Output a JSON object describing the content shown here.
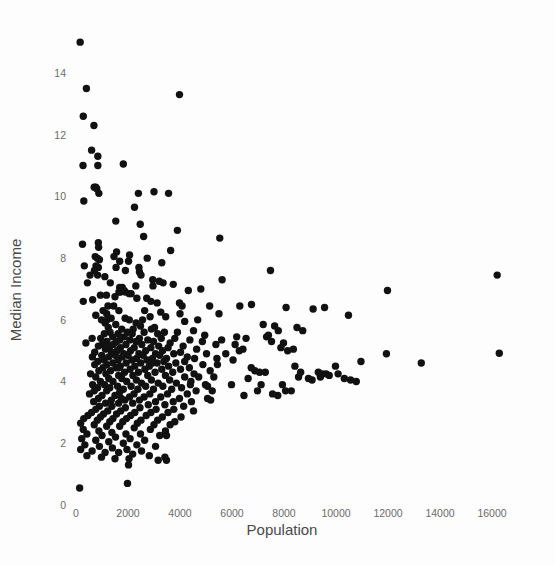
{
  "chart_data": {
    "type": "scatter",
    "title": "",
    "xlabel": "Population",
    "ylabel": "Median Income",
    "xlim": [
      -700,
      17400
    ],
    "ylim": [
      -0.45,
      15.6
    ],
    "xticks": [
      0,
      2000,
      4000,
      6000,
      8000,
      10000,
      12000,
      14000,
      16000
    ],
    "xticklabels": [
      "0",
      "2000",
      "4000",
      "6000",
      "8000",
      "10000",
      "12000",
      "14000",
      "16000"
    ],
    "yticks": [
      0,
      2,
      4,
      6,
      8,
      10,
      12,
      14
    ],
    "yticklabels": [
      "0",
      "2",
      "4",
      "6",
      "8",
      "10",
      "12",
      "14"
    ],
    "grid": false,
    "legend": null,
    "marker": {
      "shape": "circle",
      "color": "#111111",
      "size": 4.6
    },
    "n_points": 420,
    "points": [
      [
        160,
        15.0
      ],
      [
        400,
        13.5
      ],
      [
        3980,
        13.3
      ],
      [
        280,
        12.6
      ],
      [
        690,
        12.3
      ],
      [
        600,
        11.5
      ],
      [
        840,
        11.3
      ],
      [
        270,
        11.0
      ],
      [
        840,
        11.0
      ],
      [
        1820,
        11.05
      ],
      [
        700,
        10.3
      ],
      [
        760,
        10.3
      ],
      [
        800,
        10.25
      ],
      [
        880,
        10.1
      ],
      [
        2400,
        10.1
      ],
      [
        3000,
        10.15
      ],
      [
        3560,
        10.1
      ],
      [
        300,
        9.85
      ],
      [
        2250,
        9.65
      ],
      [
        1530,
        9.2
      ],
      [
        2470,
        9.1
      ],
      [
        3900,
        8.9
      ],
      [
        2600,
        8.7
      ],
      [
        5530,
        8.65
      ],
      [
        860,
        8.5
      ],
      [
        250,
        8.45
      ],
      [
        870,
        8.35
      ],
      [
        3640,
        8.25
      ],
      [
        1560,
        8.2
      ],
      [
        2060,
        8.1
      ],
      [
        740,
        8.05
      ],
      [
        820,
        8.0
      ],
      [
        900,
        7.95
      ],
      [
        1680,
        7.9
      ],
      [
        2020,
        7.9
      ],
      [
        320,
        7.75
      ],
      [
        770,
        7.75
      ],
      [
        860,
        7.7
      ],
      [
        1540,
        7.7
      ],
      [
        2420,
        7.7
      ],
      [
        710,
        7.6
      ],
      [
        1900,
        7.6
      ],
      [
        2440,
        7.55
      ],
      [
        7480,
        7.6
      ],
      [
        16200,
        7.45
      ],
      [
        2500,
        7.45
      ],
      [
        830,
        7.45
      ],
      [
        1110,
        7.4
      ],
      [
        2950,
        7.3
      ],
      [
        5620,
        7.3
      ],
      [
        3200,
        7.25
      ],
      [
        3350,
        7.2
      ],
      [
        440,
        7.2
      ],
      [
        2300,
        7.1
      ],
      [
        2960,
        7.1
      ],
      [
        1680,
        7.05
      ],
      [
        1780,
        7.05
      ],
      [
        4800,
        7.0
      ],
      [
        1850,
        6.95
      ],
      [
        4320,
        6.95
      ],
      [
        11980,
        6.95
      ],
      [
        1650,
        6.9
      ],
      [
        1710,
        6.9
      ],
      [
        1900,
        6.9
      ],
      [
        2050,
        6.85
      ],
      [
        940,
        6.8
      ],
      [
        1170,
        6.8
      ],
      [
        1500,
        6.75
      ],
      [
        2340,
        6.7
      ],
      [
        2720,
        6.7
      ],
      [
        640,
        6.65
      ],
      [
        280,
        6.6
      ],
      [
        3120,
        6.55
      ],
      [
        3980,
        6.55
      ],
      [
        6300,
        6.45
      ],
      [
        6750,
        6.5
      ],
      [
        1230,
        6.45
      ],
      [
        1450,
        6.45
      ],
      [
        5140,
        6.45
      ],
      [
        8080,
        6.4
      ],
      [
        9120,
        6.35
      ],
      [
        9560,
        6.4
      ],
      [
        1040,
        6.3
      ],
      [
        1650,
        6.3
      ],
      [
        2640,
        6.3
      ],
      [
        3260,
        6.25
      ],
      [
        4000,
        6.2
      ],
      [
        1180,
        6.2
      ],
      [
        760,
        6.15
      ],
      [
        10480,
        6.15
      ],
      [
        2850,
        6.1
      ],
      [
        3450,
        6.1
      ],
      [
        1350,
        6.05
      ],
      [
        1890,
        6.05
      ],
      [
        980,
        6.0
      ],
      [
        2050,
        6.0
      ],
      [
        4180,
        5.95
      ],
      [
        2310,
        5.9
      ],
      [
        1120,
        5.9
      ],
      [
        1530,
        5.85
      ],
      [
        7200,
        5.85
      ],
      [
        7640,
        5.8
      ],
      [
        2480,
        5.8
      ],
      [
        3020,
        5.75
      ],
      [
        1240,
        5.75
      ],
      [
        8500,
        5.75
      ],
      [
        1760,
        5.7
      ],
      [
        2200,
        5.7
      ],
      [
        2900,
        5.7
      ],
      [
        4520,
        5.65
      ],
      [
        7780,
        5.65
      ],
      [
        8720,
        5.65
      ],
      [
        1310,
        5.6
      ],
      [
        1980,
        5.6
      ],
      [
        2620,
        5.6
      ],
      [
        3400,
        5.6
      ],
      [
        1090,
        5.55
      ],
      [
        1620,
        5.55
      ],
      [
        2160,
        5.55
      ],
      [
        3140,
        5.55
      ],
      [
        4950,
        5.5
      ],
      [
        6180,
        5.45
      ],
      [
        7330,
        5.45
      ],
      [
        1410,
        5.45
      ],
      [
        1850,
        5.45
      ],
      [
        2440,
        5.4
      ],
      [
        3280,
        5.4
      ],
      [
        3800,
        5.4
      ],
      [
        950,
        5.4
      ],
      [
        1680,
        5.35
      ],
      [
        2070,
        5.35
      ],
      [
        2760,
        5.35
      ],
      [
        4380,
        5.35
      ],
      [
        7520,
        5.3
      ],
      [
        7980,
        5.25
      ],
      [
        1190,
        5.3
      ],
      [
        1560,
        5.3
      ],
      [
        2310,
        5.3
      ],
      [
        2980,
        5.3
      ],
      [
        3620,
        5.25
      ],
      [
        5380,
        5.2
      ],
      [
        1020,
        5.2
      ],
      [
        1440,
        5.2
      ],
      [
        1920,
        5.2
      ],
      [
        2530,
        5.2
      ],
      [
        3180,
        5.15
      ],
      [
        4120,
        5.15
      ],
      [
        860,
        5.15
      ],
      [
        1280,
        5.1
      ],
      [
        1710,
        5.1
      ],
      [
        2240,
        5.1
      ],
      [
        2880,
        5.1
      ],
      [
        3540,
        5.1
      ],
      [
        4640,
        5.05
      ],
      [
        6420,
        5.05
      ],
      [
        8140,
        5.0
      ],
      [
        1130,
        5.05
      ],
      [
        1590,
        5.0
      ],
      [
        2100,
        5.0
      ],
      [
        2680,
        5.0
      ],
      [
        3330,
        5.0
      ],
      [
        4020,
        4.95
      ],
      [
        720,
        4.95
      ],
      [
        1370,
        4.95
      ],
      [
        1840,
        4.9
      ],
      [
        2420,
        4.9
      ],
      [
        3060,
        4.9
      ],
      [
        3760,
        4.9
      ],
      [
        5020,
        4.9
      ],
      [
        11940,
        4.9
      ],
      [
        16280,
        4.92
      ],
      [
        990,
        4.85
      ],
      [
        1510,
        4.85
      ],
      [
        2000,
        4.85
      ],
      [
        2580,
        4.85
      ],
      [
        3220,
        4.85
      ],
      [
        4280,
        4.8
      ],
      [
        630,
        4.8
      ],
      [
        1260,
        4.8
      ],
      [
        1780,
        4.8
      ],
      [
        2330,
        4.75
      ],
      [
        2940,
        4.75
      ],
      [
        3480,
        4.75
      ],
      [
        4560,
        4.75
      ],
      [
        6040,
        4.7
      ],
      [
        10960,
        4.65
      ],
      [
        13280,
        4.6
      ],
      [
        1080,
        4.7
      ],
      [
        1620,
        4.7
      ],
      [
        2150,
        4.7
      ],
      [
        2730,
        4.7
      ],
      [
        3380,
        4.65
      ],
      [
        4180,
        4.65
      ],
      [
        840,
        4.65
      ],
      [
        1420,
        4.6
      ],
      [
        1930,
        4.6
      ],
      [
        2490,
        4.6
      ],
      [
        3120,
        4.6
      ],
      [
        3840,
        4.6
      ],
      [
        4880,
        4.55
      ],
      [
        5440,
        4.55
      ],
      [
        8420,
        4.5
      ],
      [
        9980,
        4.5
      ],
      [
        720,
        4.55
      ],
      [
        1190,
        4.55
      ],
      [
        1700,
        4.5
      ],
      [
        2260,
        4.5
      ],
      [
        2820,
        4.5
      ],
      [
        3560,
        4.5
      ],
      [
        4360,
        4.45
      ],
      [
        1040,
        4.45
      ],
      [
        1540,
        4.45
      ],
      [
        2080,
        4.4
      ],
      [
        2650,
        4.4
      ],
      [
        3300,
        4.4
      ],
      [
        4020,
        4.4
      ],
      [
        5160,
        4.35
      ],
      [
        6880,
        4.35
      ],
      [
        7060,
        4.3
      ],
      [
        9320,
        4.3
      ],
      [
        9480,
        4.25
      ],
      [
        9620,
        4.25
      ],
      [
        880,
        4.35
      ],
      [
        1330,
        4.35
      ],
      [
        1870,
        4.3
      ],
      [
        2400,
        4.3
      ],
      [
        3040,
        4.3
      ],
      [
        3720,
        4.3
      ],
      [
        4540,
        4.25
      ],
      [
        560,
        4.25
      ],
      [
        1150,
        4.25
      ],
      [
        1640,
        4.2
      ],
      [
        2190,
        4.2
      ],
      [
        2760,
        4.2
      ],
      [
        3440,
        4.2
      ],
      [
        4180,
        4.15
      ],
      [
        5300,
        4.15
      ],
      [
        6620,
        4.1
      ],
      [
        8560,
        4.15
      ],
      [
        8940,
        4.1
      ],
      [
        10560,
        4.05
      ],
      [
        760,
        4.15
      ],
      [
        1260,
        4.1
      ],
      [
        1760,
        4.1
      ],
      [
        2320,
        4.05
      ],
      [
        2900,
        4.05
      ],
      [
        3600,
        4.05
      ],
      [
        4420,
        4.0
      ],
      [
        940,
        4.0
      ],
      [
        1420,
        4.0
      ],
      [
        1950,
        4.0
      ],
      [
        2520,
        3.95
      ],
      [
        3160,
        3.95
      ],
      [
        3860,
        3.95
      ],
      [
        4980,
        3.9
      ],
      [
        5980,
        3.9
      ],
      [
        7120,
        3.9
      ],
      [
        7940,
        3.9
      ],
      [
        640,
        3.9
      ],
      [
        1100,
        3.9
      ],
      [
        1600,
        3.85
      ],
      [
        2120,
        3.85
      ],
      [
        2680,
        3.85
      ],
      [
        3340,
        3.85
      ],
      [
        4060,
        3.8
      ],
      [
        830,
        3.8
      ],
      [
        1300,
        3.8
      ],
      [
        1820,
        3.75
      ],
      [
        2380,
        3.75
      ],
      [
        2980,
        3.75
      ],
      [
        3680,
        3.75
      ],
      [
        4620,
        3.7
      ],
      [
        5240,
        3.7
      ],
      [
        6980,
        3.7
      ],
      [
        8280,
        3.7
      ],
      [
        700,
        3.7
      ],
      [
        1180,
        3.7
      ],
      [
        1680,
        3.65
      ],
      [
        2230,
        3.6
      ],
      [
        2840,
        3.6
      ],
      [
        3520,
        3.6
      ],
      [
        4280,
        3.6
      ],
      [
        6460,
        3.55
      ],
      [
        7760,
        3.55
      ],
      [
        520,
        3.6
      ],
      [
        1000,
        3.55
      ],
      [
        1500,
        3.55
      ],
      [
        2060,
        3.5
      ],
      [
        2620,
        3.5
      ],
      [
        3260,
        3.5
      ],
      [
        3980,
        3.45
      ],
      [
        5060,
        3.45
      ],
      [
        5180,
        3.4
      ],
      [
        860,
        3.45
      ],
      [
        1360,
        3.4
      ],
      [
        1880,
        3.4
      ],
      [
        2440,
        3.4
      ],
      [
        3060,
        3.35
      ],
      [
        3740,
        3.35
      ],
      [
        4440,
        3.35
      ],
      [
        680,
        3.35
      ],
      [
        1140,
        3.3
      ],
      [
        1640,
        3.3
      ],
      [
        2180,
        3.3
      ],
      [
        2780,
        3.25
      ],
      [
        3420,
        3.25
      ],
      [
        4140,
        3.2
      ],
      [
        900,
        3.2
      ],
      [
        1380,
        3.2
      ],
      [
        1900,
        3.15
      ],
      [
        2460,
        3.15
      ],
      [
        3080,
        3.1
      ],
      [
        3760,
        3.1
      ],
      [
        4520,
        3.05
      ],
      [
        760,
        3.1
      ],
      [
        1220,
        3.05
      ],
      [
        1720,
        3.05
      ],
      [
        2260,
        3.0
      ],
      [
        2880,
        3.0
      ],
      [
        3540,
        3.0
      ],
      [
        600,
        3.0
      ],
      [
        1060,
        2.95
      ],
      [
        1560,
        2.95
      ],
      [
        2100,
        2.9
      ],
      [
        2700,
        2.9
      ],
      [
        3320,
        2.85
      ],
      [
        4040,
        2.85
      ],
      [
        460,
        2.9
      ],
      [
        940,
        2.85
      ],
      [
        1420,
        2.8
      ],
      [
        1940,
        2.8
      ],
      [
        2500,
        2.75
      ],
      [
        3140,
        2.75
      ],
      [
        3800,
        2.7
      ],
      [
        300,
        2.8
      ],
      [
        820,
        2.75
      ],
      [
        1300,
        2.7
      ],
      [
        1800,
        2.7
      ],
      [
        2360,
        2.65
      ],
      [
        3000,
        2.6
      ],
      [
        3620,
        2.6
      ],
      [
        180,
        2.65
      ],
      [
        700,
        2.6
      ],
      [
        1180,
        2.55
      ],
      [
        1680,
        2.55
      ],
      [
        2240,
        2.5
      ],
      [
        2860,
        2.45
      ],
      [
        3440,
        2.4
      ],
      [
        280,
        2.45
      ],
      [
        880,
        2.4
      ],
      [
        1380,
        2.35
      ],
      [
        1920,
        2.3
      ],
      [
        2480,
        2.3
      ],
      [
        3220,
        2.25
      ],
      [
        3480,
        2.25
      ],
      [
        420,
        2.3
      ],
      [
        1000,
        2.25
      ],
      [
        1520,
        2.2
      ],
      [
        2080,
        2.15
      ],
      [
        2640,
        2.1
      ],
      [
        220,
        2.15
      ],
      [
        760,
        2.1
      ],
      [
        1260,
        2.05
      ],
      [
        1820,
        2.0
      ],
      [
        2340,
        1.95
      ],
      [
        3060,
        1.9
      ],
      [
        340,
        1.95
      ],
      [
        900,
        1.9
      ],
      [
        1400,
        1.85
      ],
      [
        1960,
        1.8
      ],
      [
        2520,
        1.75
      ],
      [
        180,
        1.8
      ],
      [
        620,
        1.75
      ],
      [
        1120,
        1.7
      ],
      [
        1640,
        1.7
      ],
      [
        2180,
        1.65
      ],
      [
        2820,
        1.6
      ],
      [
        3420,
        1.55
      ],
      [
        420,
        1.6
      ],
      [
        980,
        1.55
      ],
      [
        1500,
        1.5
      ],
      [
        2040,
        1.5
      ],
      [
        3480,
        1.45
      ],
      [
        2020,
        1.3
      ],
      [
        1980,
        0.7
      ],
      [
        140,
        0.55
      ],
      [
        3160,
        1.45
      ],
      [
        4720,
        4.15
      ],
      [
        5420,
        4.75
      ],
      [
        6120,
        5.2
      ],
      [
        6740,
        4.45
      ],
      [
        7280,
        4.3
      ],
      [
        7560,
        3.6
      ],
      [
        8060,
        3.7
      ],
      [
        8640,
        4.3
      ],
      [
        9080,
        4.05
      ],
      [
        9400,
        4.15
      ],
      [
        9740,
        4.2
      ],
      [
        10080,
        4.25
      ],
      [
        10320,
        4.1
      ],
      [
        10780,
        4.0
      ],
      [
        4860,
        5.3
      ],
      [
        5600,
        5.35
      ],
      [
        6280,
        5.0
      ],
      [
        4680,
        6.0
      ],
      [
        5500,
        6.2
      ],
      [
        4400,
        3.9
      ],
      [
        5060,
        3.85
      ],
      [
        5760,
        4.9
      ],
      [
        6540,
        5.4
      ],
      [
        7400,
        5.5
      ],
      [
        7880,
        5.1
      ],
      [
        8360,
        5.05
      ],
      [
        2120,
        6.85
      ],
      [
        2880,
        6.6
      ],
      [
        1320,
        7.2
      ],
      [
        540,
        7.45
      ],
      [
        3740,
        7.15
      ],
      [
        4080,
        6.45
      ],
      [
        1460,
        8.05
      ],
      [
        2740,
        8.0
      ],
      [
        3300,
        7.85
      ],
      [
        1200,
        6.0
      ],
      [
        2560,
        6.0
      ],
      [
        3900,
        5.6
      ],
      [
        1640,
        4.45
      ],
      [
        2940,
        4.6
      ],
      [
        620,
        5.4
      ],
      [
        380,
        5.25
      ],
      [
        1740,
        3.45
      ]
    ]
  },
  "axis": {
    "x_title": "Population",
    "y_title": "Median Income"
  }
}
